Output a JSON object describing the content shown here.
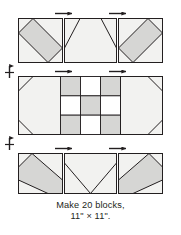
{
  "figure": {
    "kind": "quilt-block-assembly-diagram",
    "caption_lines": [
      "Make 20 blocks,",
      "11\" × 11\"."
    ],
    "caption_full": "Make 20 blocks, 11\" × 11\".",
    "block_count": "20",
    "finished_size": "11\" × 11\""
  },
  "colors": {
    "background": "#ffffff",
    "outline": "#231f20",
    "light_fill": "#f2f2f0",
    "medium_fill": "#d6d6d4",
    "dark_fill": "#b3b3b0",
    "text": "#231f20",
    "arrow": "#231f20"
  },
  "rows": [
    {
      "name": "top-row",
      "units": [
        {
          "name": "top-left-unit",
          "type": "diagonal-stripe-square",
          "shading": "medium",
          "description": "Square with medium gray diagonal band running corner to corner"
        },
        {
          "name": "top-center-unit",
          "type": "trapezoid-rectangle",
          "shading": "light",
          "description": "Wide rectangle with light trapezoid and angled corners"
        },
        {
          "name": "top-right-unit",
          "type": "diagonal-stripe-square-mirrored",
          "shading": "medium",
          "description": "Mirrored square with medium gray diagonal band"
        }
      ]
    },
    {
      "name": "middle-row",
      "units": [
        {
          "name": "middle-left-unit",
          "type": "clipped-corner-rectangle",
          "shading": "light",
          "description": "Light rectangle with clipped upper and lower corners"
        },
        {
          "name": "nine-patch-center",
          "type": "nine-patch",
          "description": "Three by three checkerboard of alternating gray and white squares",
          "grid": [
            [
              "medium",
              "white",
              "medium"
            ],
            [
              "white",
              "medium",
              "white"
            ],
            [
              "medium",
              "white",
              "medium"
            ]
          ]
        },
        {
          "name": "middle-right-unit",
          "type": "clipped-corner-rectangle-mirrored",
          "shading": "light",
          "description": "Mirrored light rectangle with clipped corners"
        }
      ]
    },
    {
      "name": "bottom-row",
      "units": [
        {
          "name": "bottom-left-unit",
          "type": "diagonal-stripe-square",
          "shading": "medium",
          "description": "Square with medium gray diagonal band"
        },
        {
          "name": "bottom-center-unit",
          "type": "chevron-rectangle",
          "shading": "light",
          "description": "Wide rectangle with light chevron point"
        },
        {
          "name": "bottom-right-unit",
          "type": "diagonal-stripe-square-mirrored",
          "shading": "medium",
          "description": "Mirrored square with medium gray diagonal band"
        }
      ]
    }
  ],
  "arrows": {
    "horizontal": [
      {
        "name": "seam-arrow-top-left",
        "direction": "right"
      },
      {
        "name": "seam-arrow-top-right",
        "direction": "right"
      },
      {
        "name": "seam-arrow-middle-left",
        "direction": "right"
      },
      {
        "name": "seam-arrow-middle-right",
        "direction": "right"
      },
      {
        "name": "seam-arrow-bottom-left",
        "direction": "right"
      },
      {
        "name": "seam-arrow-bottom-right",
        "direction": "right"
      }
    ],
    "vertical": [
      {
        "name": "seam-arrow-row-gap-upper",
        "direction": "up-down"
      },
      {
        "name": "seam-arrow-row-gap-lower",
        "direction": "up-down"
      }
    ]
  }
}
